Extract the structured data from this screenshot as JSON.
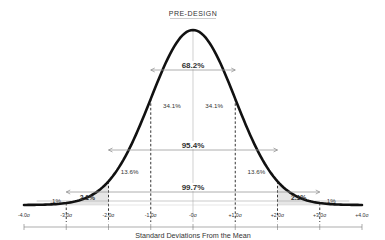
{
  "header": {
    "title": "PRE-DESIGN"
  },
  "chart_data": {
    "type": "area",
    "title": "PRE-DESIGN",
    "xlabel": "Standard Deviations From the Mean",
    "ylabel": "",
    "distribution": "normal",
    "mean": 0,
    "sd": 1,
    "xlim": [
      -4,
      4
    ],
    "grid": false,
    "legend": "none",
    "tick_labels": [
      "-4.0σ",
      "-3.0σ",
      "-2.0σ",
      "-1.0σ",
      "-0σ",
      "+1.0σ",
      "+2.0σ",
      "+3.0σ",
      "+4.0σ"
    ],
    "tick_values": [
      -4,
      -3,
      -2,
      -1,
      0,
      1,
      2,
      3,
      4
    ],
    "segments": [
      {
        "from": -4,
        "to": -3,
        "percent": ".1%",
        "shaded": true
      },
      {
        "from": -3,
        "to": -2,
        "percent": "2.1%",
        "shaded": true
      },
      {
        "from": -2,
        "to": -1,
        "percent": "13.6%",
        "shaded": false
      },
      {
        "from": -1,
        "to": 0,
        "percent": "34.1%",
        "shaded": false
      },
      {
        "from": 0,
        "to": 1,
        "percent": "34.1%",
        "shaded": false
      },
      {
        "from": 1,
        "to": 2,
        "percent": "13.6%",
        "shaded": false
      },
      {
        "from": 2,
        "to": 3,
        "percent": "2.1%",
        "shaded": true
      },
      {
        "from": 3,
        "to": 4,
        "percent": ".1%",
        "shaded": true
      }
    ],
    "ranges": [
      {
        "label": "68.2%",
        "from": -1,
        "to": 1
      },
      {
        "label": "95.4%",
        "from": -2,
        "to": 2
      },
      {
        "label": "99.7%",
        "from": -3,
        "to": 3
      }
    ]
  },
  "colors": {
    "curve": "#111111",
    "shade": "#e6e6e6",
    "lines": "#999999",
    "dashed": "#333333",
    "text": "#333333"
  }
}
